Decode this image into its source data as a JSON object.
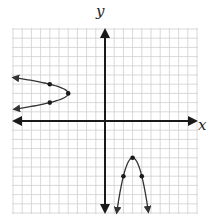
{
  "chart_data": {
    "type": "line",
    "title": "",
    "xlabel": "x",
    "ylabel": "y",
    "xlim": [
      -10,
      10
    ],
    "ylim": [
      -10,
      10
    ],
    "grid": true,
    "tick_labels": false,
    "series": [
      {
        "name": "sideways parabola (opens left)",
        "equation": "x = -2(y - 3)^2 - 4",
        "vertex": [
          -4,
          3
        ],
        "marked_points": [
          [
            -6,
            4
          ],
          [
            -4,
            3
          ],
          [
            -6,
            2
          ]
        ],
        "arrows_at_ends": true
      },
      {
        "name": "downward parabola",
        "equation": "y = -2(x - 3)^2 - 4",
        "vertex": [
          3,
          -4
        ],
        "marked_points": [
          [
            2,
            -6
          ],
          [
            3,
            -4
          ],
          [
            4,
            -6
          ]
        ],
        "arrows_at_ends": true
      }
    ]
  },
  "labels": {
    "x": "x",
    "y": "y"
  },
  "colors": {
    "grid": "#cfcfcf",
    "axis": "#1a1a1a",
    "curve": "#333333",
    "point": "#1a1a1a"
  }
}
